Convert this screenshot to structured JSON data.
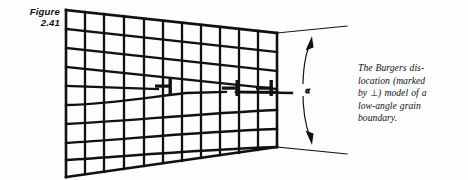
{
  "figure": {
    "label_line1": "Figure",
    "label_line2": "2.41",
    "label_full": "Figure 2.41",
    "caption_line1": "The Burgers dis-",
    "caption_line2": "location (marked",
    "caption_line3_a": "by",
    "caption_perp_symbol": "⊥",
    "caption_line3_b": ") model of a",
    "caption_line4": "low-angle grain",
    "caption_line5": "boundary.",
    "caption_full": "The Burgers dislocation (marked by ⊥) model of a low-angle grain boundary.",
    "angle_symbol": "α"
  },
  "colors": {
    "background": "#fdfdfd",
    "ink": "#111111",
    "grid_stroke": "#111111",
    "thin_stroke": "#111111"
  },
  "diagram": {
    "type": "crystal-lattice-low-angle-grain-boundary",
    "grid_corners": {
      "top_left": [
        66,
        10
      ],
      "top_right": [
        277,
        33
      ],
      "bottom_right": [
        277,
        147
      ],
      "bottom_left": [
        66,
        177
      ]
    },
    "columns": 11,
    "rows_left": 9,
    "rows_right": 6,
    "dislocations": [
      {
        "x": 163,
        "y": 91
      },
      {
        "x": 230,
        "y": 93
      },
      {
        "x": 296,
        "y": 93
      }
    ],
    "angle_arc": {
      "label": "α",
      "label_x": 308,
      "label_y": 91,
      "top_point": [
        312,
        40
      ],
      "bottom_point": [
        311,
        141
      ]
    },
    "extension_lines": [
      {
        "from": [
          277,
          33
        ],
        "to": [
          345,
          27
        ]
      },
      {
        "from": [
          277,
          147
        ],
        "to": [
          345,
          153
        ]
      }
    ]
  }
}
